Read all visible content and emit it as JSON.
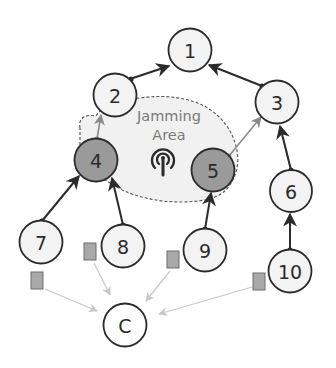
{
  "diagram": {
    "jamming_area": {
      "label_line1": "Jamming",
      "label_line2": "Area",
      "icon": "antenna-broadcast-icon"
    },
    "colors": {
      "node_fill": "#f3f3f3",
      "jammed_node_fill": "#9a9a9a",
      "stroke": "#2b2b2b",
      "gray_edge": "#8a8a8a",
      "report_edge": "#c8c8c8",
      "packet_fill": "#a8a8a8",
      "jam_area_fill": "#f1f1f1",
      "jam_area_stroke": "#555555"
    },
    "nodes": [
      {
        "id": "1",
        "label": "1",
        "x": 190,
        "y": 50,
        "jammed": false
      },
      {
        "id": "2",
        "label": "2",
        "x": 115,
        "y": 95,
        "jammed": false
      },
      {
        "id": "3",
        "label": "3",
        "x": 277,
        "y": 102,
        "jammed": false
      },
      {
        "id": "4",
        "label": "4",
        "x": 96,
        "y": 160,
        "jammed": true
      },
      {
        "id": "5",
        "label": "5",
        "x": 213,
        "y": 170,
        "jammed": true
      },
      {
        "id": "6",
        "label": "6",
        "x": 291,
        "y": 191,
        "jammed": false
      },
      {
        "id": "7",
        "label": "7",
        "x": 41,
        "y": 242,
        "jammed": false
      },
      {
        "id": "8",
        "label": "8",
        "x": 123,
        "y": 246,
        "jammed": false
      },
      {
        "id": "9",
        "label": "9",
        "x": 205,
        "y": 250,
        "jammed": false
      },
      {
        "id": "10",
        "label": "10",
        "x": 290,
        "y": 271,
        "jammed": false
      },
      {
        "id": "C",
        "label": "C",
        "x": 125,
        "y": 325,
        "jammed": false
      }
    ],
    "edges": [
      {
        "from": "2",
        "to": "1",
        "style": "solid-black"
      },
      {
        "from": "3",
        "to": "1",
        "style": "solid-black"
      },
      {
        "from": "4",
        "to": "2",
        "style": "gray"
      },
      {
        "from": "5",
        "to": "3",
        "style": "gray"
      },
      {
        "from": "6",
        "to": "3",
        "style": "solid-black"
      },
      {
        "from": "7",
        "to": "4",
        "style": "solid-black"
      },
      {
        "from": "8",
        "to": "4",
        "style": "solid-black"
      },
      {
        "from": "9",
        "to": "5",
        "style": "solid-black"
      },
      {
        "from": "10",
        "to": "6",
        "style": "solid-black"
      }
    ],
    "reports": [
      {
        "from_node": "7",
        "packet": "packet-7",
        "to": "C"
      },
      {
        "from_node": "8",
        "packet": "packet-8",
        "to": "C"
      },
      {
        "from_node": "9",
        "packet": "packet-9",
        "to": "C"
      },
      {
        "from_node": "10",
        "packet": "packet-10",
        "to": "C"
      }
    ]
  }
}
